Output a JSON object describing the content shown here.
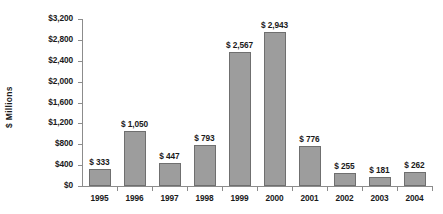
{
  "chart_data": {
    "type": "bar",
    "title": "",
    "subtitle": "",
    "xlabel": "",
    "ylabel": "$ Millions",
    "categories": [
      "1995",
      "1996",
      "1997",
      "1998",
      "1999",
      "2000",
      "2001",
      "2002",
      "2003",
      "2004"
    ],
    "values": [
      333,
      1050,
      447,
      793,
      2567,
      2943,
      776,
      255,
      181,
      262
    ],
    "data_labels": [
      "$ 333",
      "$ 1,050",
      "$ 447",
      "$ 793",
      "$ 2,567",
      "$ 2,943",
      "$ 776",
      "$ 255",
      "$ 181",
      "$ 262"
    ],
    "ylim": [
      0,
      3200
    ],
    "ytick_step": 400,
    "ytick_labels": [
      "$3,200",
      "$2,800",
      "$2,400",
      "$2,000",
      "$1,600",
      "$1,200",
      "$800",
      "$400",
      "$0"
    ],
    "ytick_values": [
      3200,
      2800,
      2400,
      2000,
      1600,
      1200,
      800,
      400,
      0
    ],
    "grid": false,
    "legend": false,
    "legend_position": "none",
    "series": [
      {
        "name": "",
        "values": [
          333,
          1050,
          447,
          793,
          2567,
          2943,
          776,
          255,
          181,
          262
        ]
      }
    ],
    "colors": {
      "bar_fill": "#9d9d9d",
      "bar_border": "#6f6f6f",
      "axis": "#8c8c8c",
      "text": "#1a1a1a",
      "background": "#ffffff"
    }
  }
}
